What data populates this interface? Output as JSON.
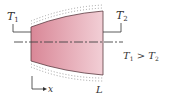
{
  "diagram": {
    "type": "tapered fin / conduction schematic",
    "labels": {
      "t1": {
        "main": "T",
        "sub": "1"
      },
      "t2": {
        "main": "T",
        "sub": "2"
      },
      "relation": {
        "a_main": "T",
        "a_sub": "1",
        "op": " > ",
        "b_main": "T",
        "b_sub": "2"
      },
      "x_axis": "x",
      "length": "L"
    },
    "colors": {
      "fill_left": "#d98797",
      "fill_right": "#f2cfd6",
      "outline": "#5a3a40",
      "insulation_dots": "#9a9a9a",
      "lines": "#333333"
    }
  }
}
